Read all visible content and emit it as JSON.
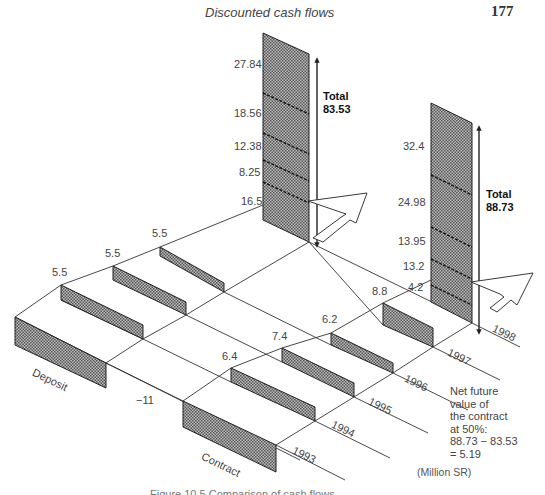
{
  "header": {
    "running_title": "Discounted cash flows",
    "page_number": "177"
  },
  "diagram": {
    "type": "isometric cash-flow comparison",
    "rows": [
      {
        "name": "Deposit",
        "label": "Deposit"
      },
      {
        "name": "Contract",
        "label": "Contract"
      }
    ],
    "years": [
      "1993",
      "1994",
      "1995",
      "1996",
      "1997",
      "1998"
    ],
    "deposit": {
      "initial_outflow_label": "",
      "flows": [
        {
          "label": "5.5"
        },
        {
          "label": "5.5"
        },
        {
          "label": "5.5"
        }
      ],
      "compounded_components": [
        "27.84",
        "18.56",
        "12.38",
        "8.25",
        "16.5"
      ],
      "total_label": "Total",
      "total_value": "83.53"
    },
    "contract": {
      "initial_outflow_label": "−11",
      "flows": [
        {
          "label": "6.4"
        },
        {
          "label": "7.4"
        },
        {
          "label": "6.2"
        },
        {
          "label": "8.8"
        }
      ],
      "compounded_components": [
        "32.4",
        "24.98",
        "13.95",
        "13.2",
        "4.2"
      ],
      "total_label": "Total",
      "total_value": "88.73"
    },
    "note": {
      "lines": [
        "Net future",
        "value of",
        "the contract",
        "at 50%:",
        "88.73 − 83.53",
        "= 5.19"
      ]
    },
    "units": "(Million SR)",
    "colors": {
      "bar_fill": "#8a8a8a",
      "line": "#333333",
      "background": "#ffffff"
    }
  },
  "caption": "Figure 10.5 Comparison of cash flows"
}
